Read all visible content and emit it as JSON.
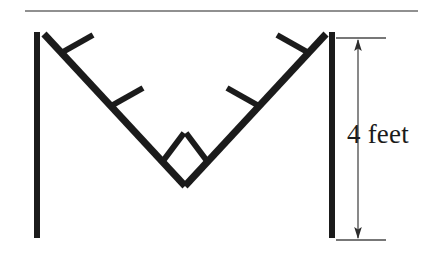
{
  "figure": {
    "type": "line-diagram",
    "canvas": {
      "width": 443,
      "height": 264,
      "background": "#ffffff"
    },
    "colors": {
      "structure": "#1b1b1b",
      "rule": "#6b6b6b",
      "dimension": "#4a4a4a",
      "text": "#1b1b1b",
      "background": "#ffffff"
    },
    "top_rule": {
      "x1": 25,
      "y1": 11,
      "x2": 418,
      "y2": 11,
      "thickness": 1.6
    },
    "posts": [
      {
        "name": "left-post",
        "x": 37,
        "y_top": 32,
        "y_bottom": 238,
        "thickness": 6
      },
      {
        "name": "right-post",
        "x": 332,
        "y_top": 32,
        "y_bottom": 238,
        "thickness": 6
      }
    ],
    "beams": [
      {
        "name": "left-diagonal",
        "x1": 44,
        "y1": 34,
        "x2": 185,
        "y2": 186,
        "thickness": 7
      },
      {
        "name": "right-diagonal",
        "x1": 185,
        "y1": 186,
        "x2": 326,
        "y2": 34,
        "thickness": 7
      }
    ],
    "rungs": [
      {
        "name": "rung-left-upper",
        "x1": 61,
        "y1": 53,
        "x2": 93,
        "y2": 35,
        "thickness": 6
      },
      {
        "name": "rung-left-middle",
        "x1": 111,
        "y1": 106,
        "x2": 143,
        "y2": 88,
        "thickness": 6
      },
      {
        "name": "rung-left-lower",
        "x1": 163,
        "y1": 161,
        "x2": 184,
        "y2": 133,
        "thickness": 6
      },
      {
        "name": "rung-right-lower",
        "x1": 207,
        "y1": 161,
        "x2": 186,
        "y2": 133,
        "thickness": 6
      },
      {
        "name": "rung-right-middle",
        "x1": 259,
        "y1": 106,
        "x2": 227,
        "y2": 88,
        "thickness": 6
      },
      {
        "name": "rung-right-upper",
        "x1": 309,
        "y1": 53,
        "x2": 277,
        "y2": 35,
        "thickness": 6
      }
    ],
    "dimension": {
      "label": "4 feet",
      "value": 4,
      "unit": "feet",
      "line_x": 358,
      "y_top": 38,
      "y_bottom": 240,
      "extension_top": {
        "x1": 336,
        "y1": 38,
        "x2": 386,
        "y2": 38
      },
      "extension_bottom": {
        "x1": 336,
        "y1": 240,
        "x2": 386,
        "y2": 240
      },
      "arrows": [
        "up",
        "down"
      ]
    }
  }
}
